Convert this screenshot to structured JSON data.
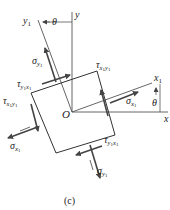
{
  "figure": {
    "caption": "(c)",
    "angle_label": "θ",
    "origin_label": "O",
    "axes": {
      "x": "x",
      "y": "y",
      "x1_base": "x",
      "x1_sub": "1",
      "y1_base": "y",
      "y1_sub": "1"
    },
    "stresses": {
      "sigma_x1": {
        "base": "σ",
        "sub": "x",
        "subsub": "1"
      },
      "sigma_y1": {
        "base": "σ",
        "sub": "y",
        "subsub": "1"
      },
      "tau_x1y1": {
        "base": "τ",
        "sub": "x",
        "sub2": "1",
        "sub3": "y",
        "sub4": "1"
      },
      "tau_y1x1": {
        "base": "τ",
        "sub": "y",
        "sub2": "1",
        "sub3": "x",
        "sub4": "1"
      }
    },
    "colors": {
      "line": "#3a3a3a",
      "arrow": "#444444",
      "text": "#222222"
    }
  }
}
